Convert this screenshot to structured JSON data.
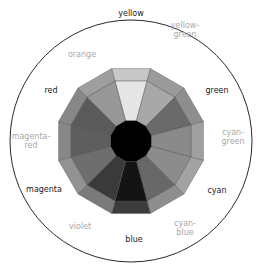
{
  "diagram": {
    "center": [
      131,
      141
    ],
    "outer_circle_radius": 121,
    "wheel_outer_radius": 75,
    "wheel_inner_ring_radius": 62,
    "hub_radius": 21,
    "hub_color": "#000000",
    "circle_stroke": "#2a2a2a",
    "segments": [
      {
        "name": "yellow",
        "type": "primary",
        "angle": 0,
        "inner": "#e6e6e6",
        "outer": "#c8c8c8"
      },
      {
        "name": "yellow-green",
        "type": "secondary",
        "angle": 30,
        "inner": "#a8a8a8",
        "outer": "#9a9a9a"
      },
      {
        "name": "green",
        "type": "primary",
        "angle": 60,
        "inner": "#6a6a6a",
        "outer": "#8e8e8e"
      },
      {
        "name": "cyan-green",
        "type": "secondary",
        "angle": 90,
        "inner": "#8a8a8a",
        "outer": "#a0a0a0"
      },
      {
        "name": "cyan",
        "type": "primary",
        "angle": 120,
        "inner": "#8c8c8c",
        "outer": "#a2a2a2"
      },
      {
        "name": "cyan-blue",
        "type": "secondary",
        "angle": 150,
        "inner": "#686868",
        "outer": "#8e8e8e"
      },
      {
        "name": "blue",
        "type": "primary",
        "angle": 180,
        "inner": "#141414",
        "outer": "#3c3c3c"
      },
      {
        "name": "violet",
        "type": "secondary",
        "angle": 210,
        "inner": "#3a3a3a",
        "outer": "#7a7a7a"
      },
      {
        "name": "magenta",
        "type": "primary",
        "angle": 240,
        "inner": "#6e6e6e",
        "outer": "#929292"
      },
      {
        "name": "magenta-red",
        "type": "secondary",
        "angle": 270,
        "inner": "#5e5e5e",
        "outer": "#888888"
      },
      {
        "name": "red",
        "type": "primary",
        "angle": 300,
        "inner": "#5a5a5a",
        "outer": "#878787"
      },
      {
        "name": "orange",
        "type": "secondary",
        "angle": 330,
        "inner": "#979797",
        "outer": "#9e9e9e"
      }
    ],
    "labels": [
      {
        "text": "yellow",
        "line2": "",
        "type": "primary",
        "x": 131,
        "y": 13
      },
      {
        "text": "yellow-",
        "line2": "green",
        "type": "secondary",
        "x": 185,
        "y": 30
      },
      {
        "text": "green",
        "line2": "",
        "type": "primary",
        "x": 217,
        "y": 90
      },
      {
        "text": "cyan-",
        "line2": "green",
        "type": "secondary",
        "x": 233,
        "y": 137
      },
      {
        "text": "cyan",
        "line2": "",
        "type": "primary",
        "x": 217,
        "y": 190
      },
      {
        "text": "cyan-",
        "line2": "blue",
        "type": "secondary",
        "x": 185,
        "y": 228
      },
      {
        "text": "blue",
        "line2": "",
        "type": "primary",
        "x": 134,
        "y": 239
      },
      {
        "text": "violet",
        "line2": "",
        "type": "secondary",
        "x": 80,
        "y": 226
      },
      {
        "text": "magenta",
        "line2": "",
        "type": "primary",
        "x": 44,
        "y": 189
      },
      {
        "text": "magenta-",
        "line2": "red",
        "type": "secondary",
        "x": 31,
        "y": 141
      },
      {
        "text": "red",
        "line2": "",
        "type": "primary",
        "x": 51,
        "y": 90
      },
      {
        "text": "orange",
        "line2": "",
        "type": "secondary",
        "x": 82,
        "y": 54
      }
    ]
  }
}
